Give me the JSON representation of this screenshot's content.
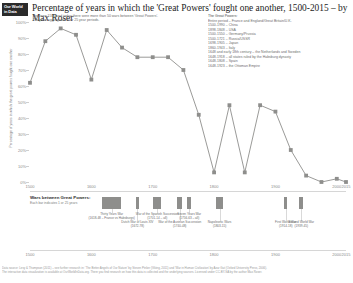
{
  "brand": {
    "line1": "Our World",
    "line2": "in Data"
  },
  "header": {
    "title": "Percentage of years in which the 'Great Powers' fought one another, 1500-2015 – by Max Roser",
    "subtitle_lines": [
      "Between 1500 and today there were more than 50 wars between 'Great Powers'.",
      "They are aggregated over 25 year periods."
    ]
  },
  "legend": {
    "heading": "The Great Powers:",
    "items": [
      "Entire period – France and England/Great Britain/U.K.",
      "1500-1990 – China",
      "1898-1848 – USA",
      "1500-1550 – Germany/Prussia",
      "1500-1721 – Russia/USSR",
      "1698-1905 – Japan",
      "1860-1943 – Italy",
      "1648 and early 18th century – the Netherlands and Sweden",
      "1648-1918 – all states ruled by the Habsburg dynasty",
      "1648-1808 – Spain",
      "1648-1923 – the Ottoman Empire"
    ]
  },
  "chart_data": {
    "type": "line",
    "title": "Percentage of years in which the 'Great Powers' fought one another, 1500-2015",
    "xlabel": "",
    "ylabel": "Percentage of years in which the great powers fought one another",
    "xlim": [
      1500,
      2015
    ],
    "ylim": [
      0,
      100
    ],
    "yticks": [
      "100%",
      "90%",
      "80%",
      "70%",
      "60%",
      "50%",
      "40%",
      "30%",
      "20%",
      "10%",
      "0%"
    ],
    "xticks": [
      "1500",
      "1600",
      "1700",
      "1800",
      "1900",
      "2000",
      "2015"
    ],
    "xtick_values": [
      1500,
      1600,
      1700,
      1800,
      1900,
      2000,
      2015
    ],
    "grid": false,
    "legend_position": "none",
    "series": [
      {
        "name": "Percentage of years with war between Great Powers",
        "x": [
          1500,
          1525,
          1550,
          1575,
          1600,
          1625,
          1650,
          1675,
          1700,
          1725,
          1750,
          1775,
          1800,
          1825,
          1850,
          1875,
          1900,
          1925,
          1950,
          1975,
          2000,
          2015
        ],
        "values": [
          62,
          88,
          96,
          92,
          64,
          95,
          84,
          78,
          78,
          78,
          70,
          42,
          6,
          48,
          6,
          48,
          44,
          20,
          4,
          0,
          2,
          0
        ]
      }
    ]
  },
  "wars_panel": {
    "title": "Wars between Great Powers:",
    "subtitle": "Each bar indicates 1 or 25 years",
    "events": [
      {
        "label_lines": [
          "Thirty Years War",
          "(1618-48 – France vs Habsburgs)"
        ],
        "start": 1618,
        "end": 1648
      },
      {
        "label_lines": [
          "Dutch War of Louis XIV",
          "(1672-78)"
        ],
        "start": 1672,
        "end": 1678
      },
      {
        "label_lines": [
          "War of the Spanish Succession",
          "(1701-14 – all)"
        ],
        "start": 1701,
        "end": 1714
      },
      {
        "label_lines": [
          "War of the Austrian Succession",
          "(1740-48)"
        ],
        "start": 1740,
        "end": 1748
      },
      {
        "label_lines": [
          "Seven Years War",
          "(1756-63 – all)"
        ],
        "start": 1756,
        "end": 1763
      },
      {
        "label_lines": [
          "Napoleonic Wars",
          "(1803-15)"
        ],
        "start": 1803,
        "end": 1815
      },
      {
        "label_lines": [
          "First World War",
          "(1914-18)"
        ],
        "start": 1914,
        "end": 1918
      },
      {
        "label_lines": [
          "Second World War",
          "(1939-45)"
        ],
        "start": 1939,
        "end": 1945
      }
    ]
  },
  "footer": {
    "lines": [
      "Data source: Levy & Thompson (2011) – see further research in: 'The Better Angels of Our Nature' by Steven Pinker (Viking, 2011) and 'War in Human Civilization' by Azar Gat (Oxford University Press, 2006).",
      "The interactive data visualization is available at OurWorldInData.org. There you find research on how this data is collected and the underlying sources. Licensed under CC-BY-SA by the author Max Roser."
    ]
  },
  "colors": {
    "line": "#8e8e8c",
    "marker": "#8e8e8c",
    "logo_bg": "#2b2b2b",
    "text": "#3b3b3b",
    "muted": "#7d7d7d"
  }
}
